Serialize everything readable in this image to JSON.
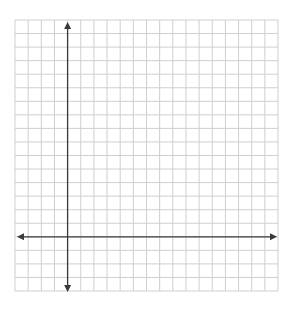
{
  "diagram": {
    "type": "coordinate-plane",
    "grid": {
      "columns": 20,
      "rows": 20,
      "left": 15,
      "top": 20,
      "right": 278,
      "bottom": 291,
      "line_color": "#cfcfcf"
    },
    "axes": {
      "color": "#3a3a3a",
      "x_axis_row_index": 16,
      "y_axis_col_index": 4,
      "arrows": [
        "left",
        "right",
        "up",
        "down"
      ],
      "labels_visible": false
    },
    "background_color": "#ffffff"
  }
}
